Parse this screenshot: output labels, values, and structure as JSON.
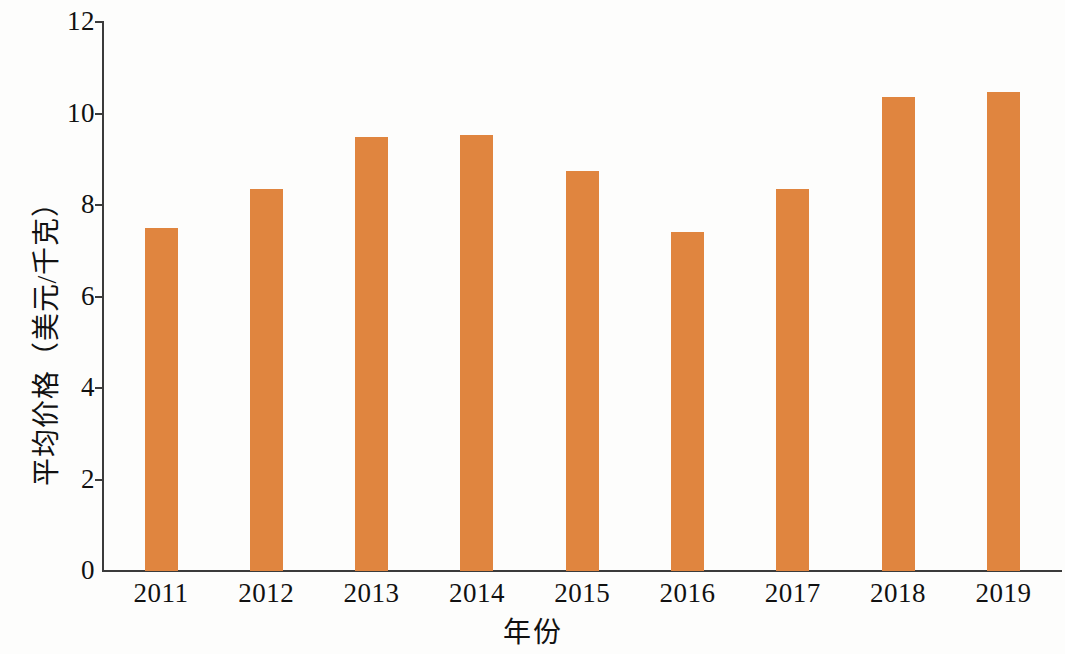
{
  "chart_data": {
    "type": "bar",
    "title": "",
    "subtitle": "",
    "xlabel": "年份",
    "ylabel": "平均价格（美元/千克）",
    "categories": [
      "2011",
      "2012",
      "2013",
      "2014",
      "2015",
      "2016",
      "2017",
      "2018",
      "2019"
    ],
    "values": [
      7.5,
      8.35,
      9.48,
      9.52,
      8.75,
      7.4,
      8.34,
      10.37,
      10.47
    ],
    "series": [
      {
        "name": "平均价格",
        "values": [
          7.5,
          8.35,
          9.48,
          9.52,
          8.75,
          7.4,
          8.34,
          10.37,
          10.47
        ]
      }
    ],
    "ylim": [
      0,
      12
    ],
    "y_ticks": [
      0,
      2,
      4,
      6,
      8,
      10,
      12
    ],
    "y_tick_labels": [
      "0",
      "2",
      "4",
      "6",
      "8",
      "10",
      "12"
    ],
    "x_tick_labels": [
      "2011",
      "2012",
      "2013",
      "2014",
      "2015",
      "2016",
      "2017",
      "2018",
      "2019"
    ],
    "grid": false,
    "legend": false,
    "legend_position": "none",
    "bar_color": "#e0853f",
    "axis_color": "#3b3b3b",
    "background_color": "#fdfdfc",
    "annotations": []
  }
}
